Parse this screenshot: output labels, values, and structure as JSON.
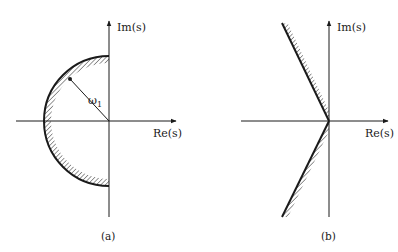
{
  "figure": {
    "panels": [
      {
        "id": "a",
        "caption": "(a)",
        "x_axis_label": "Re(s)",
        "y_axis_label": "Im(s)",
        "radius_label": "ω",
        "radius_label_sub": "1",
        "region": "left half-plane semicircle of radius ω1, hatched on the inside"
      },
      {
        "id": "b",
        "caption": "(b)",
        "x_axis_label": "Re(s)",
        "y_axis_label": "Im(s)",
        "region": "wedge bounded by two rays from origin into left half-plane, hatched toward imaginary axis"
      }
    ],
    "colors": {
      "ink": "#1a1a1a",
      "background": "#ffffff"
    }
  }
}
